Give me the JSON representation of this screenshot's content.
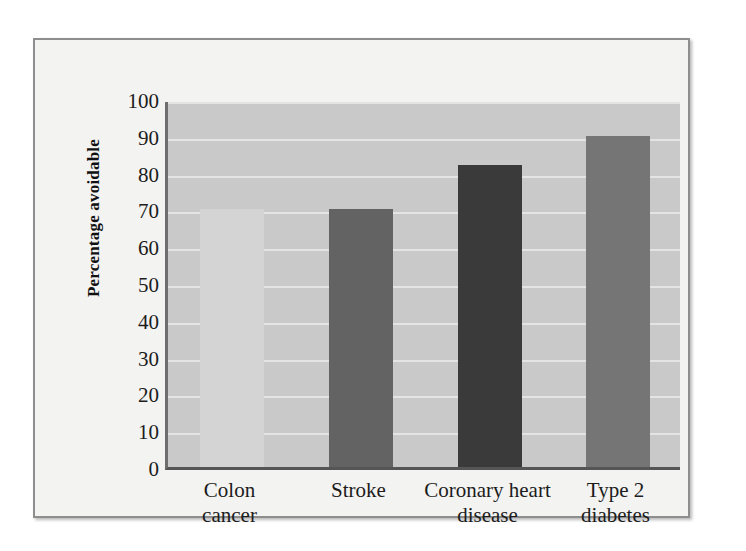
{
  "figure": {
    "background_color": "#f3f3f1",
    "frame_border_color": "#8e8e8e",
    "plot_background_color": "#c9c9c9",
    "gridline_color": "#e4e4e2",
    "axis_color": "#555555"
  },
  "chart_data": {
    "type": "bar",
    "title": "",
    "subtitle": "",
    "xlabel": "",
    "ylabel": "Percentage avoidable",
    "categories": [
      "Colon cancer",
      "Stroke",
      "Coronary heart disease",
      "Type 2 diabetes"
    ],
    "category_lines": [
      [
        "Colon",
        "cancer"
      ],
      [
        "Stroke"
      ],
      [
        "Coronary heart",
        "disease"
      ],
      [
        "Type 2",
        "diabetes"
      ]
    ],
    "values": [
      70,
      70,
      82,
      90
    ],
    "bar_colors": [
      "#d4d4d4",
      "#636363",
      "#3a3a3a",
      "#757575"
    ],
    "ylim": [
      0,
      100
    ],
    "ytick_labels": [
      "100",
      "90",
      "80",
      "70",
      "60",
      "50",
      "40",
      "30",
      "20",
      "10",
      "0"
    ],
    "ytick_values": [
      100,
      90,
      80,
      70,
      60,
      50,
      40,
      30,
      20,
      10,
      0
    ],
    "ytick_step": 10,
    "grid": true,
    "grid_axis": "y",
    "legend": false,
    "legend_position": "none",
    "annotations": []
  }
}
